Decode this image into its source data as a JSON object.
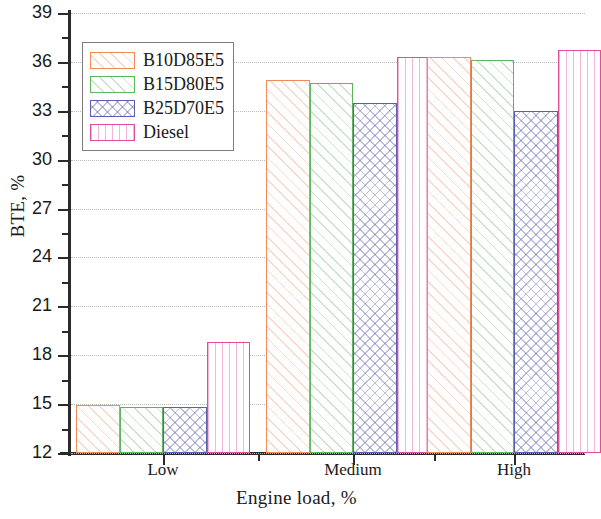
{
  "chart_data": {
    "type": "bar",
    "title": "",
    "xlabel": "Engine load, %",
    "ylabel": "BTE, %",
    "categories": [
      "Low",
      "Medium",
      "High"
    ],
    "series": [
      {
        "name": "B10D85E5",
        "values": [
          14.95,
          34.9,
          36.3
        ],
        "color": "#ED8B5A",
        "pattern": "diagonal-hatch"
      },
      {
        "name": "B15D80E5",
        "values": [
          14.8,
          34.7,
          36.1
        ],
        "color": "#5FB45F",
        "pattern": "diagonal-hatch"
      },
      {
        "name": "B25D70E5",
        "values": [
          14.8,
          33.5,
          33.0
        ],
        "color": "#5B5FB0",
        "pattern": "cross-hatch"
      },
      {
        "name": "Diesel",
        "values": [
          18.8,
          36.3,
          36.7
        ],
        "color": "#E34B9B",
        "pattern": "vertical-lines"
      }
    ],
    "ylim": [
      12,
      39
    ],
    "ytick_labels": [
      "12",
      "15",
      "18",
      "21",
      "24",
      "27",
      "30",
      "33",
      "36",
      "39"
    ],
    "ytick_values": [
      12,
      15,
      18,
      21,
      24,
      27,
      30,
      33,
      36,
      39
    ],
    "yminor_values": [
      13.5,
      16.5,
      19.5,
      22.5,
      25.5,
      28.5,
      31.5,
      34.5,
      37.5
    ],
    "grid": true,
    "legend_position": "upper-left",
    "legend_entries": [
      "B10D85E5",
      "B15D80E5",
      "B25D70E5",
      "Diesel"
    ]
  }
}
